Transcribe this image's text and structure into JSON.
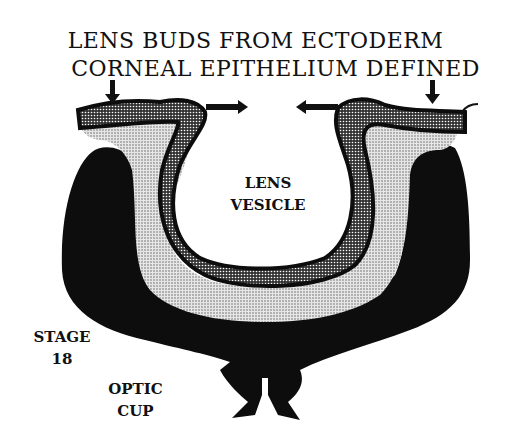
{
  "diagram": {
    "title_line1": "LENS BUDS FROM ECTODERM",
    "title_line2": "CORNEAL EPITHELIUM DEFINED",
    "labels": {
      "lens_vesicle_1": "LENS",
      "lens_vesicle_2": "VESICLE",
      "stage_1": "STAGE",
      "stage_2": "18",
      "optic_cup_1": "OPTIC",
      "optic_cup_2": "CUP"
    },
    "structures": [
      "ectoderm-epithelium-cells",
      "stippled-mesenchyme",
      "optic-cup-black-layer",
      "optic-stalk"
    ],
    "arrows": [
      "down-arrow-left",
      "right-arrow",
      "left-arrow",
      "down-arrow-right"
    ],
    "colors": {
      "ink": "#111111",
      "stipple": "#cfcfcf",
      "background": "#ffffff"
    }
  }
}
